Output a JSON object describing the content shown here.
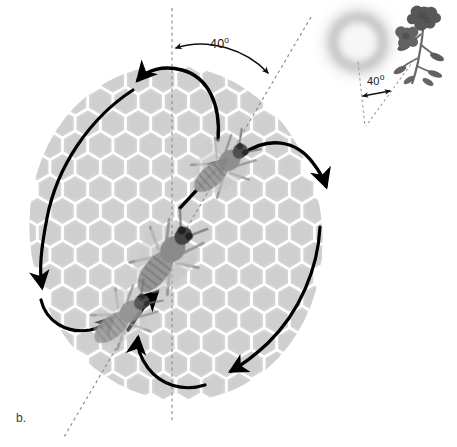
{
  "figure": {
    "panel_label": "b.",
    "title_semantic": "honeybee-waggle-dance-diagram",
    "background_color": "#ffffff"
  },
  "hive_panel": {
    "name": "honeycomb-dance-floor",
    "comb_color": "#d2d2d2",
    "comb_gap_color": "#ffffff",
    "vertical_reference_line": {
      "label_semantic": "gravity-vertical-dashed-line",
      "color": "#8c8c8c",
      "style": "dashed"
    },
    "waggle_axis_line": {
      "label_semantic": "waggle-run-axis-dashed-line",
      "color": "#8c8c8c",
      "style": "dashed",
      "tilt_degrees": 40
    },
    "angle_annotation": {
      "value": "40",
      "degree_symbol": "o",
      "full_text": "40o",
      "arc_color": "#111111"
    },
    "bees": [
      {
        "name": "bee-upper-right",
        "orientation_label": "waggle-run-upper"
      },
      {
        "name": "bee-center",
        "orientation_label": "waggle-run-center"
      },
      {
        "name": "bee-lower-left",
        "orientation_label": "waggle-run-lower"
      }
    ],
    "dance_arrows": [
      {
        "name": "arrow-left-loop-down",
        "direction": "counterclockwise"
      },
      {
        "name": "arrow-left-loop-return",
        "direction": "counterclockwise"
      },
      {
        "name": "arrow-top-loop",
        "direction": "counterclockwise"
      },
      {
        "name": "arrow-right-loop-top",
        "direction": "clockwise"
      },
      {
        "name": "arrow-right-loop-down",
        "direction": "clockwise"
      },
      {
        "name": "arrow-bottom-return",
        "direction": "clockwise"
      },
      {
        "name": "arrow-waggle-run-upper",
        "direction": "up-right"
      },
      {
        "name": "arrow-waggle-run-lower",
        "direction": "up-right"
      }
    ]
  },
  "field_inset": {
    "name": "sun-and-flower-inset",
    "sun": {
      "name": "sun-glow",
      "color": "#b8b8b8",
      "style": "blurred-ring"
    },
    "flower": {
      "name": "flower-cluster",
      "color": "#5e5e5e"
    },
    "sun_reference_line": {
      "label_semantic": "sun-direction-dashed-line",
      "color": "#9a9a9a",
      "style": "dashed"
    },
    "flower_reference_line": {
      "label_semantic": "flower-direction-dashed-line",
      "color": "#9a9a9a",
      "style": "dashed"
    },
    "angle_annotation": {
      "value": "40",
      "degree_symbol": "o",
      "full_text": "40o",
      "arrow_color": "#111111"
    }
  }
}
